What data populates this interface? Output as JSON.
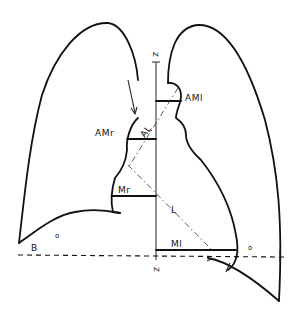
{
  "diagram": {
    "title": "",
    "labels": {
      "axis_top": "Z",
      "axis_bottom": "Z",
      "am_left_upper": "AMr",
      "al": "AL",
      "am_right_upper": "AMl",
      "m_left": "Mr",
      "l": "L",
      "m_right": "Ml",
      "b": "B",
      "dot_left": "o",
      "dot_right": "o"
    },
    "colors": {
      "line": "#111111",
      "background": "#ffffff"
    }
  }
}
